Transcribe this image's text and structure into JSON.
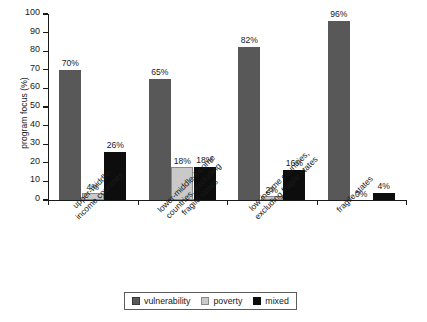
{
  "chart_data": {
    "type": "bar",
    "title": "",
    "subtitle": "",
    "xlabel": "",
    "ylabel": "program focus (%)",
    "ylim": [
      0,
      100
    ],
    "yticks": [
      0,
      10,
      20,
      30,
      40,
      50,
      60,
      70,
      80,
      90,
      100
    ],
    "ytick_labels": [
      "0",
      "10",
      "20",
      "30",
      "40",
      "50",
      "60",
      "70",
      "80",
      "90",
      "100"
    ],
    "grid": false,
    "legend_position": "bottom",
    "categories": [
      "upper-middle-income countries",
      "lower-middle-income countries, excluding fragile states",
      "low-income countries, excluding fragile states",
      "fragile states"
    ],
    "category_lines": [
      [
        "upper-middle-",
        "income countries"
      ],
      [
        "lower-middle-income",
        "countries, excluding",
        "fragile states"
      ],
      [
        "low-income countries,",
        "excluding fragile states"
      ],
      [
        "fragile states"
      ]
    ],
    "series": [
      {
        "name": "vulnerability",
        "color": "#585858",
        "values": [
          70,
          65,
          82,
          96
        ],
        "labels": [
          "70%",
          "65%",
          "82%",
          "96%"
        ]
      },
      {
        "name": "poverty",
        "color": "#c9c9c9",
        "values": [
          4,
          18,
          2,
          0
        ],
        "labels": [
          "4%",
          "18%",
          "2%",
          "0%"
        ]
      },
      {
        "name": "mixed",
        "color": "#0d0d0d",
        "values": [
          26,
          18,
          16,
          4
        ],
        "labels": [
          "26%",
          "18%",
          "16%",
          "4%"
        ]
      }
    ]
  },
  "legend": {
    "items": [
      {
        "label": "vulnerability",
        "swatch": "vulnerability"
      },
      {
        "label": "poverty",
        "swatch": "poverty"
      },
      {
        "label": "mixed",
        "swatch": "mixed"
      }
    ]
  }
}
